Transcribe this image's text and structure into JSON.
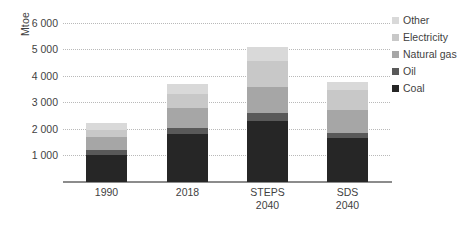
{
  "chart_data": {
    "type": "bar",
    "title": "",
    "subtitle": "",
    "xlabel": "",
    "ylabel": "Mtoe",
    "stacked": true,
    "grid": true,
    "legend_position": "right",
    "ylim": [
      0,
      6400
    ],
    "yticks": [
      1000,
      2000,
      3000,
      4000,
      5000,
      6000
    ],
    "ytick_labels": [
      "1 000",
      "2 000",
      "3 000",
      "4 000",
      "5 000",
      "6 000"
    ],
    "categories": [
      "1990",
      "2018",
      "STEPS\n2040",
      "SDS\n2040"
    ],
    "category_lines": [
      [
        "1990",
        ""
      ],
      [
        "2018",
        ""
      ],
      [
        "STEPS",
        "2040"
      ],
      [
        "SDS",
        "2040"
      ]
    ],
    "series": [
      {
        "name": "Coal",
        "color": "#262626",
        "values": [
          1020,
          1790,
          2310,
          1640
        ]
      },
      {
        "name": "Oil",
        "color": "#595959",
        "values": [
          190,
          240,
          280,
          190
        ]
      },
      {
        "name": "Natural gas",
        "color": "#a6a6a6",
        "values": [
          480,
          750,
          990,
          870
        ]
      },
      {
        "name": "Electricity",
        "color": "#c8c8c8",
        "values": [
          250,
          540,
          990,
          760
        ]
      },
      {
        "name": "Other",
        "color": "#d9d9d9",
        "values": [
          290,
          380,
          510,
          290
        ]
      }
    ],
    "totals": [
      2230,
      3700,
      5080,
      3750
    ]
  },
  "legend": {
    "items": [
      {
        "label": "Other",
        "color": "#d9d9d9"
      },
      {
        "label": "Electricity",
        "color": "#c8c8c8"
      },
      {
        "label": "Natural gas",
        "color": "#a6a6a6"
      },
      {
        "label": "Oil",
        "color": "#595959"
      },
      {
        "label": "Coal",
        "color": "#262626"
      }
    ]
  }
}
